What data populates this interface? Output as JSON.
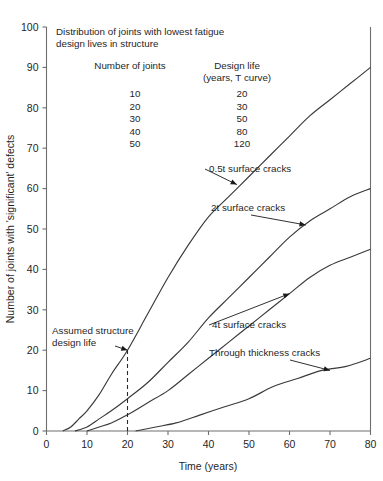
{
  "chart_data": {
    "type": "line",
    "title": "",
    "xlabel": "Time (years)",
    "ylabel": "Number of joints with 'significant' defects",
    "xlim": [
      0,
      80
    ],
    "ylim": [
      0,
      100
    ],
    "xticks": [
      0,
      10,
      20,
      30,
      40,
      50,
      60,
      70,
      80
    ],
    "yticks": [
      0,
      10,
      20,
      30,
      40,
      50,
      60,
      70,
      80,
      90,
      100
    ],
    "grid": false,
    "legend_position": "inline-annotations",
    "series": [
      {
        "name": "0.5t surface cracks",
        "points": [
          [
            4,
            0
          ],
          [
            6,
            1
          ],
          [
            8,
            3
          ],
          [
            10,
            5
          ],
          [
            13,
            9
          ],
          [
            16,
            14
          ],
          [
            20,
            20
          ],
          [
            25,
            29
          ],
          [
            30,
            38
          ],
          [
            35,
            46
          ],
          [
            40,
            53
          ],
          [
            45,
            58
          ],
          [
            50,
            63
          ],
          [
            55,
            68
          ],
          [
            60,
            73
          ],
          [
            65,
            78
          ],
          [
            70,
            82
          ],
          [
            75,
            86
          ],
          [
            80,
            90
          ]
        ]
      },
      {
        "name": "2t surface cracks",
        "points": [
          [
            7,
            0
          ],
          [
            10,
            1
          ],
          [
            13,
            3
          ],
          [
            16,
            5
          ],
          [
            20,
            8
          ],
          [
            25,
            12
          ],
          [
            30,
            17
          ],
          [
            35,
            22
          ],
          [
            40,
            28
          ],
          [
            45,
            33
          ],
          [
            50,
            38
          ],
          [
            55,
            43
          ],
          [
            60,
            48
          ],
          [
            65,
            52
          ],
          [
            70,
            55
          ],
          [
            75,
            58
          ],
          [
            80,
            60
          ]
        ]
      },
      {
        "name": "4t surface cracks",
        "points": [
          [
            10,
            0
          ],
          [
            13,
            1
          ],
          [
            16,
            2
          ],
          [
            20,
            4
          ],
          [
            25,
            7
          ],
          [
            30,
            10
          ],
          [
            35,
            14
          ],
          [
            40,
            18
          ],
          [
            45,
            22
          ],
          [
            50,
            26
          ],
          [
            55,
            30
          ],
          [
            60,
            34
          ],
          [
            65,
            38
          ],
          [
            70,
            41
          ],
          [
            75,
            43
          ],
          [
            80,
            45
          ]
        ]
      },
      {
        "name": "Through thickness cracks",
        "points": [
          [
            22,
            0
          ],
          [
            27,
            1
          ],
          [
            32,
            2
          ],
          [
            38,
            4
          ],
          [
            44,
            6
          ],
          [
            50,
            8
          ],
          [
            56,
            11
          ],
          [
            62,
            13
          ],
          [
            68,
            15
          ],
          [
            74,
            16
          ],
          [
            80,
            18
          ]
        ]
      }
    ],
    "annotations": [
      {
        "label": "0.5t surface cracks",
        "series": "0.5t surface cracks",
        "target_x": 47,
        "target_y": 61
      },
      {
        "label": "2t surface cracks",
        "series": "2t surface cracks",
        "target_x": 64,
        "target_y": 51
      },
      {
        "label": "4t surface cracks",
        "series": "4t surface cracks",
        "target_x": 60,
        "target_y": 34
      },
      {
        "label": "Through thickness cracks",
        "series": "Through thickness cracks",
        "target_x": 70,
        "target_y": 15
      },
      {
        "label_line1": "Assumed structure",
        "label_line2": "design life",
        "target_x": 20,
        "target_y": 20
      }
    ],
    "reference_line": {
      "x": 20,
      "y_from": 0,
      "y_to": 20,
      "style": "dashed"
    }
  },
  "info_box": {
    "title_line1": "Distribution of joints with lowest fatigue",
    "title_line2": "design lives in structure",
    "columns": [
      "Number of joints",
      "Design life"
    ],
    "column2_subheader": "(years, T curve)",
    "rows": [
      {
        "joints": "10",
        "design_life": "20"
      },
      {
        "joints": "20",
        "design_life": "30"
      },
      {
        "joints": "30",
        "design_life": "50"
      },
      {
        "joints": "40",
        "design_life": "80"
      },
      {
        "joints": "50",
        "design_life": "120"
      }
    ]
  },
  "colors": {
    "curve": "#3a3a3a",
    "axis": "#6e6e6e",
    "text": "#1a1a1a",
    "background": "#ffffff"
  }
}
